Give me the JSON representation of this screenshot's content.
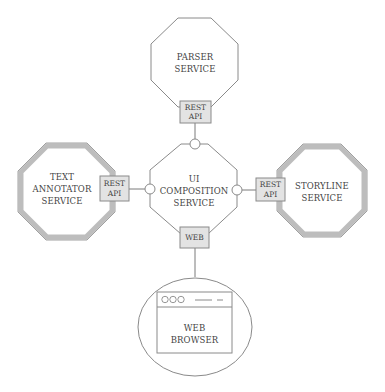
{
  "diagram": {
    "title": "",
    "colors": {
      "stroke": "#8a8a8a",
      "thick_border": "#bdbdbd",
      "fill": "#ffffff",
      "api_box_fill": "#e3e3e3",
      "text": "#444444"
    },
    "nodes": {
      "parser": {
        "line1": "PARSER",
        "line2": "SERVICE",
        "interface": {
          "line1": "REST",
          "line2": "API"
        }
      },
      "text_annotator": {
        "line1": "TEXT",
        "line2": "ANNOTATOR",
        "line3": "SERVICE",
        "interface": {
          "line1": "REST",
          "line2": "API"
        }
      },
      "ui_composition": {
        "line1": "UI",
        "line2": "COMPOSITION",
        "line3": "SERVICE",
        "interface": {
          "line1": "WEB"
        }
      },
      "storyline": {
        "line1": "STORYLINE",
        "line2": "SERVICE",
        "interface": {
          "line1": "REST",
          "line2": "API"
        }
      },
      "web_browser": {
        "line1": "WEB",
        "line2": "BROWSER",
        "window_icons": [
          "circle",
          "circle",
          "circle",
          "dash",
          "dash"
        ]
      }
    },
    "edges": [
      {
        "from": "ui_composition",
        "to": "parser",
        "via": "REST API"
      },
      {
        "from": "ui_composition",
        "to": "text_annotator",
        "via": "REST API"
      },
      {
        "from": "ui_composition",
        "to": "storyline",
        "via": "REST API"
      },
      {
        "from": "web_browser",
        "to": "ui_composition",
        "via": "WEB"
      }
    ]
  }
}
